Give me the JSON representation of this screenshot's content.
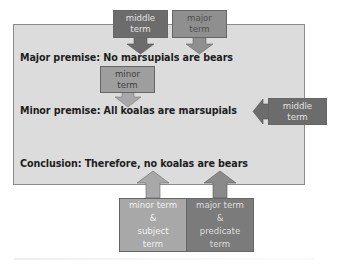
{
  "diagram": {
    "type": "syllogism-terms",
    "statements": {
      "major_premise": "Major premise: No marsupials are bears",
      "minor_premise": "Minor premise: All koalas are marsupials",
      "conclusion": "Conclusion: Therefore, no koalas are bears"
    },
    "labels": {
      "top_middle": [
        "middle",
        "term"
      ],
      "top_major": [
        "major",
        "term"
      ],
      "minor": [
        "minor",
        "term"
      ],
      "right_middle": [
        "middle",
        "term"
      ],
      "bottom_minor": [
        "minor term",
        "&",
        "subject",
        "term"
      ],
      "bottom_major": [
        "major term",
        "&",
        "predicate",
        "term"
      ]
    },
    "colors": {
      "panel": "#dcdcdc",
      "dark_box": "#6c6c6c",
      "mid_box": "#8f8f8f",
      "light_box": "#a8a8a8"
    }
  }
}
